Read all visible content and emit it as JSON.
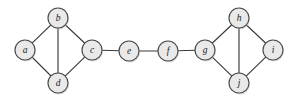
{
  "figure": {
    "background_color": "#ffffff",
    "width": 294,
    "height": 102
  },
  "style": {
    "node_fill": "#e9e9e9",
    "node_stroke": "#4a4a4a",
    "edge_stroke": "#3a3a3a",
    "label_color": "#1b1b1b",
    "node_radius": 10,
    "shadow_color": "#bdbdbd"
  },
  "chart_data": {
    "type": "diagram",
    "graph_type": "undirected",
    "node_count": 10,
    "edge_count": 13,
    "nodes": [
      {
        "id": "a",
        "label": "a",
        "x": 25,
        "y": 50
      },
      {
        "id": "b",
        "label": "b",
        "x": 58,
        "y": 18
      },
      {
        "id": "c",
        "label": "c",
        "x": 92,
        "y": 50
      },
      {
        "id": "d",
        "label": "d",
        "x": 58,
        "y": 83
      },
      {
        "id": "e",
        "label": "e",
        "x": 129,
        "y": 51
      },
      {
        "id": "f",
        "label": "f",
        "x": 168,
        "y": 51
      },
      {
        "id": "g",
        "label": "g",
        "x": 205,
        "y": 50
      },
      {
        "id": "h",
        "label": "h",
        "x": 239,
        "y": 18
      },
      {
        "id": "i",
        "label": "i",
        "x": 273,
        "y": 50
      },
      {
        "id": "j",
        "label": "j",
        "x": 239,
        "y": 83
      }
    ],
    "edges": [
      {
        "source": "a",
        "target": "b"
      },
      {
        "source": "a",
        "target": "d"
      },
      {
        "source": "b",
        "target": "c"
      },
      {
        "source": "b",
        "target": "d"
      },
      {
        "source": "c",
        "target": "d"
      },
      {
        "source": "c",
        "target": "e"
      },
      {
        "source": "e",
        "target": "f"
      },
      {
        "source": "f",
        "target": "g"
      },
      {
        "source": "g",
        "target": "h"
      },
      {
        "source": "g",
        "target": "j"
      },
      {
        "source": "h",
        "target": "i"
      },
      {
        "source": "h",
        "target": "j"
      },
      {
        "source": "i",
        "target": "j"
      }
    ]
  }
}
